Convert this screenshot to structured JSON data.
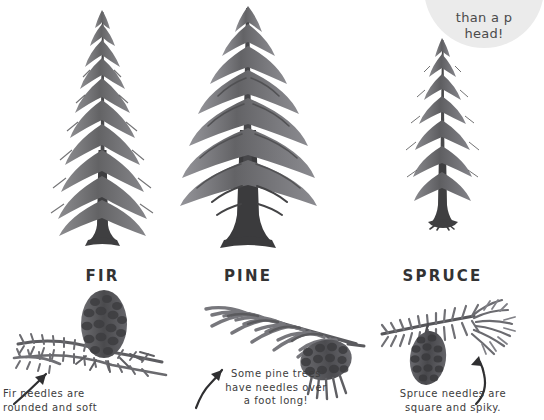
{
  "badge": {
    "text": "than a p\nhead!",
    "bg_color": "#ebebeb"
  },
  "colors": {
    "background": "#ffffff",
    "ink": "#3a3a3a",
    "foliage_dark": "#58585a",
    "foliage_mid": "#77777a",
    "foliage_light": "#9a9a9d",
    "trunk": "#3f3f41",
    "cone_dark": "#4b4b4d"
  },
  "trees": [
    {
      "id": "fir",
      "label": "FIR",
      "tree_icon": "fir-tree-illustration",
      "detail_icon": "fir-cone-and-needle-branch-illustration",
      "arrow_icon": "curved-arrow-up-right-icon",
      "caption": "Fir needles are\nrounded and soft"
    },
    {
      "id": "pine",
      "label": "PINE",
      "tree_icon": "pine-tree-illustration",
      "detail_icon": "pine-cone-and-needle-branch-illustration",
      "arrow_icon": "curved-arrow-up-right-icon",
      "caption": "Some pine trees\nhave needles over\na foot long!"
    },
    {
      "id": "spruce",
      "label": "SPRUCE",
      "tree_icon": "spruce-tree-illustration",
      "detail_icon": "spruce-cone-and-needle-branch-illustration",
      "arrow_icon": "curved-arrow-up-left-icon",
      "caption": "Spruce needles are\nsquare and spiky."
    }
  ]
}
